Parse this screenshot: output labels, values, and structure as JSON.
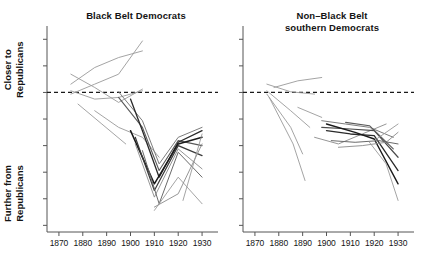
{
  "figure": {
    "width": 428,
    "height": 268,
    "background": "#ffffff"
  },
  "axis_labels": {
    "upper": "Closer to\nRepublicans",
    "upper_line1": "Closer to",
    "upper_line2": "Republicans",
    "lower_line1": "Further from",
    "lower_line2": "Republicans"
  },
  "chart_data": {
    "type": "line",
    "title": "",
    "xlabel": "",
    "ylabel": "Closer to Republicans / Further from Republicans",
    "xlim": [
      1865,
      1935
    ],
    "ylim": [
      -4.2,
      2.0
    ],
    "grid": false,
    "legend": false,
    "reference_line": {
      "y": 0,
      "style": "dashed",
      "color": "#1a1a1a",
      "label": ""
    },
    "xticks": [
      1870,
      1880,
      1890,
      1900,
      1910,
      1920,
      1930
    ],
    "xtick_labels": [
      "1870",
      "1880",
      "1890",
      "1900",
      "1910",
      "1920",
      "1930"
    ],
    "yticks": [
      1.6,
      0.8,
      0.0,
      -0.8,
      -1.6,
      -2.4,
      -3.2,
      -4.0
    ],
    "ytick_labels": [
      "",
      "",
      "",
      "",
      "",
      "",
      "",
      ""
    ],
    "panels": [
      {
        "name": "black-belt-democrats",
        "title": "Black Belt Democrats",
        "series": [
          {
            "name": "bb-1",
            "color": "#9a9a9a",
            "width": 0.9,
            "x": [
              1875,
              1885,
              1895,
              1905
            ],
            "y": [
              0.25,
              0.75,
              1.05,
              1.25
            ]
          },
          {
            "name": "bb-2",
            "color": "#9a9a9a",
            "width": 0.9,
            "x": [
              1875,
              1885,
              1895,
              1905
            ],
            "y": [
              -0.05,
              0.25,
              0.55,
              1.55
            ]
          },
          {
            "name": "bb-3",
            "color": "#9a9a9a",
            "width": 0.9,
            "x": [
              1875,
              1885,
              1895,
              1905
            ],
            "y": [
              0.55,
              0.15,
              -0.3,
              0.1
            ]
          },
          {
            "name": "bb-4",
            "color": "#9a9a9a",
            "width": 0.9,
            "x": [
              1875,
              1885,
              1895,
              1905
            ],
            "y": [
              0.05,
              -0.2,
              -0.15,
              0.05
            ]
          },
          {
            "name": "bb-5",
            "color": "#9a9a9a",
            "width": 0.9,
            "x": [
              1878,
              1888,
              1898
            ],
            "y": [
              -0.35,
              -0.95,
              -1.55
            ]
          },
          {
            "name": "bb-6",
            "color": "#9a9a9a",
            "width": 0.9,
            "x": [
              1885,
              1895,
              1905,
              1912
            ],
            "y": [
              -0.55,
              -1.05,
              -1.35,
              -1.95
            ]
          },
          {
            "name": "bb-7",
            "color": "#7d7d7d",
            "width": 1.0,
            "x": [
              1895,
              1905,
              1912,
              1920,
              1930
            ],
            "y": [
              0.02,
              -0.85,
              -2.15,
              -1.35,
              -1.05
            ]
          },
          {
            "name": "bb-8",
            "color": "#5a5a5a",
            "width": 1.1,
            "x": [
              1895,
              1905,
              1912,
              1920,
              1930
            ],
            "y": [
              -0.15,
              -1.05,
              -2.35,
              -1.45,
              -1.6
            ]
          },
          {
            "name": "bb-9",
            "color": "#2a2a2a",
            "width": 1.3,
            "x": [
              1900,
              1905,
              1912,
              1920,
              1930
            ],
            "y": [
              -0.2,
              -1.15,
              -2.55,
              -1.5,
              -1.15
            ]
          },
          {
            "name": "bb-10",
            "color": "#1a1a1a",
            "width": 1.5,
            "x": [
              1900,
              1910,
              1920,
              1930
            ],
            "y": [
              -1.15,
              -2.75,
              -1.55,
              -1.35
            ]
          },
          {
            "name": "bb-11",
            "color": "#3a3a3a",
            "width": 1.2,
            "x": [
              1902,
              1910,
              1920,
              1930
            ],
            "y": [
              -1.35,
              -2.95,
              -1.6,
              -1.9
            ]
          },
          {
            "name": "bb-12",
            "color": "#8a8a8a",
            "width": 0.9,
            "x": [
              1902,
              1910,
              1920,
              1930
            ],
            "y": [
              -1.55,
              -3.15,
              -1.7,
              -2.3
            ]
          },
          {
            "name": "bb-13",
            "color": "#6a6a6a",
            "width": 1.0,
            "x": [
              1905,
              1912,
              1920,
              1930
            ],
            "y": [
              -1.75,
              -3.35,
              -1.8,
              -2.55
            ]
          },
          {
            "name": "bb-14",
            "color": "#9a9a9a",
            "width": 0.9,
            "x": [
              1910,
              1920,
              1930
            ],
            "y": [
              -3.55,
              -2.55,
              -3.35
            ]
          },
          {
            "name": "bb-15",
            "color": "#8a8a8a",
            "width": 0.9,
            "x": [
              1910,
              1920,
              1930
            ],
            "y": [
              -3.45,
              -3.05,
              -1.55
            ]
          },
          {
            "name": "bb-16",
            "color": "#9a9a9a",
            "width": 0.9,
            "x": [
              1922,
              1930
            ],
            "y": [
              -3.25,
              -1.25
            ]
          }
        ]
      },
      {
        "name": "non-black-belt-southern-democrats",
        "title": "Non–Black Belt southern Democrats",
        "title_line1": "Non–Black Belt",
        "title_line2": "southern Democrats",
        "series": [
          {
            "name": "nb-1",
            "color": "#9a9a9a",
            "width": 0.9,
            "x": [
              1878,
              1888,
              1898
            ],
            "y": [
              0.15,
              0.35,
              0.45
            ]
          },
          {
            "name": "nb-2",
            "color": "#9a9a9a",
            "width": 0.9,
            "x": [
              1875,
              1885,
              1895
            ],
            "y": [
              0.25,
              0.02,
              -0.05
            ]
          },
          {
            "name": "nb-3",
            "color": "#9a9a9a",
            "width": 0.9,
            "x": [
              1875,
              1885,
              1893
            ],
            "y": [
              0.05,
              -0.55,
              -1.05
            ]
          },
          {
            "name": "nb-4",
            "color": "#9a9a9a",
            "width": 0.9,
            "x": [
              1875,
              1885,
              1890
            ],
            "y": [
              -0.05,
              -1.05,
              -1.85
            ]
          },
          {
            "name": "nb-5",
            "color": "#9a9a9a",
            "width": 0.9,
            "x": [
              1876,
              1886,
              1891
            ],
            "y": [
              -0.15,
              -1.55,
              -2.65
            ]
          },
          {
            "name": "nb-6",
            "color": "#9a9a9a",
            "width": 0.9,
            "x": [
              1888,
              1898
            ],
            "y": [
              -0.45,
              -0.75
            ]
          },
          {
            "name": "nb-7",
            "color": "#8a8a8a",
            "width": 0.9,
            "x": [
              1895,
              1905,
              1915,
              1925
            ],
            "y": [
              -1.35,
              -1.55,
              -1.25,
              -0.95
            ]
          },
          {
            "name": "nb-8",
            "color": "#7d7d7d",
            "width": 1.0,
            "x": [
              1898,
              1908,
              1918,
              1928
            ],
            "y": [
              -0.85,
              -0.95,
              -1.05,
              -1.35
            ]
          },
          {
            "name": "nb-9",
            "color": "#4a4a4a",
            "width": 1.2,
            "x": [
              1898,
              1910,
              1920,
              1930
            ],
            "y": [
              -1.05,
              -1.1,
              -1.15,
              -1.95
            ]
          },
          {
            "name": "nb-10",
            "color": "#2a2a2a",
            "width": 1.3,
            "x": [
              1900,
              1910,
              1920,
              1930
            ],
            "y": [
              -1.15,
              -1.25,
              -1.3,
              -2.35
            ]
          },
          {
            "name": "nb-11",
            "color": "#1a1a1a",
            "width": 1.4,
            "x": [
              1900,
              1912,
              1920,
              1930
            ],
            "y": [
              -0.95,
              -1.2,
              -1.4,
              -2.75
            ]
          },
          {
            "name": "nb-12",
            "color": "#6a6a6a",
            "width": 1.0,
            "x": [
              1902,
              1912,
              1922,
              1930
            ],
            "y": [
              -1.45,
              -1.5,
              -1.45,
              -1.55
            ]
          },
          {
            "name": "nb-13",
            "color": "#8a8a8a",
            "width": 0.9,
            "x": [
              1905,
              1915,
              1925,
              1930
            ],
            "y": [
              -1.65,
              -1.6,
              -1.5,
              -1.2
            ]
          },
          {
            "name": "nb-14",
            "color": "#5a5a5a",
            "width": 1.1,
            "x": [
              1908,
              1918,
              1928
            ],
            "y": [
              -0.9,
              -1.0,
              -1.7
            ]
          },
          {
            "name": "nb-15",
            "color": "#9a9a9a",
            "width": 0.9,
            "x": [
              1918,
              1925,
              1930
            ],
            "y": [
              -1.5,
              -2.15,
              -3.25
            ]
          },
          {
            "name": "nb-16",
            "color": "#9a9a9a",
            "width": 0.9,
            "x": [
              1920,
              1930
            ],
            "y": [
              -1.45,
              -0.95
            ]
          }
        ]
      }
    ]
  }
}
